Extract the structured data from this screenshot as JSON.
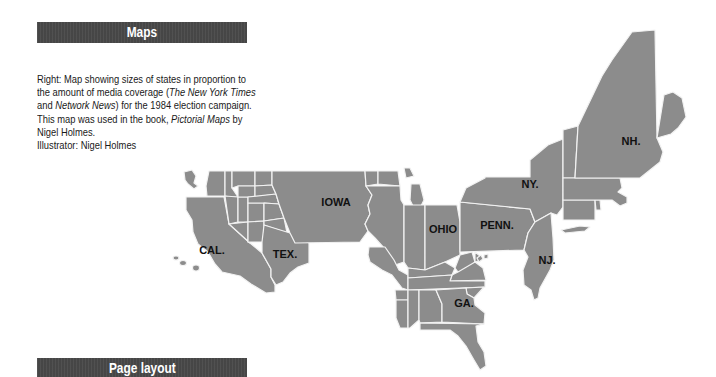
{
  "sections": {
    "maps_title": "Maps",
    "page_layout_title": "Page layout"
  },
  "caption": {
    "line1": "Right: Map showing sizes of states in proportion to",
    "line2_pre": "the amount of media coverage (",
    "line2_italic": "The New York Times",
    "line3_italic": "Network News",
    "line3_pre": "and ",
    "line3_post": ") for the 1984 election campaign.",
    "line4_pre": "This map was used in the book, ",
    "line4_italic": "Pictorial Maps",
    "line4_post": " by",
    "line5": "Nigel Holmes.",
    "line6": "Illustrator: Nigel Holmes"
  },
  "map": {
    "fill_color": "#8c8c8c",
    "border_color": "#f2f2f2",
    "labels": [
      {
        "id": "cal",
        "text": "CAL.",
        "x": 212,
        "y": 250
      },
      {
        "id": "tex",
        "text": "TEX.",
        "x": 270,
        "y": 256
      },
      {
        "id": "iowa",
        "text": "IOWA",
        "x": 318,
        "y": 206
      },
      {
        "id": "ohio",
        "text": "OHIO",
        "x": 427,
        "y": 233
      },
      {
        "id": "penn",
        "text": "PENN.",
        "x": 481,
        "y": 229
      },
      {
        "id": "ny",
        "text": "NY.",
        "x": 522,
        "y": 188
      },
      {
        "id": "nj",
        "text": "NJ.",
        "x": 537,
        "y": 262
      },
      {
        "id": "ga",
        "text": "GA.",
        "x": 453,
        "y": 307
      },
      {
        "id": "nh",
        "text": "NH.",
        "x": 621,
        "y": 144
      }
    ]
  }
}
